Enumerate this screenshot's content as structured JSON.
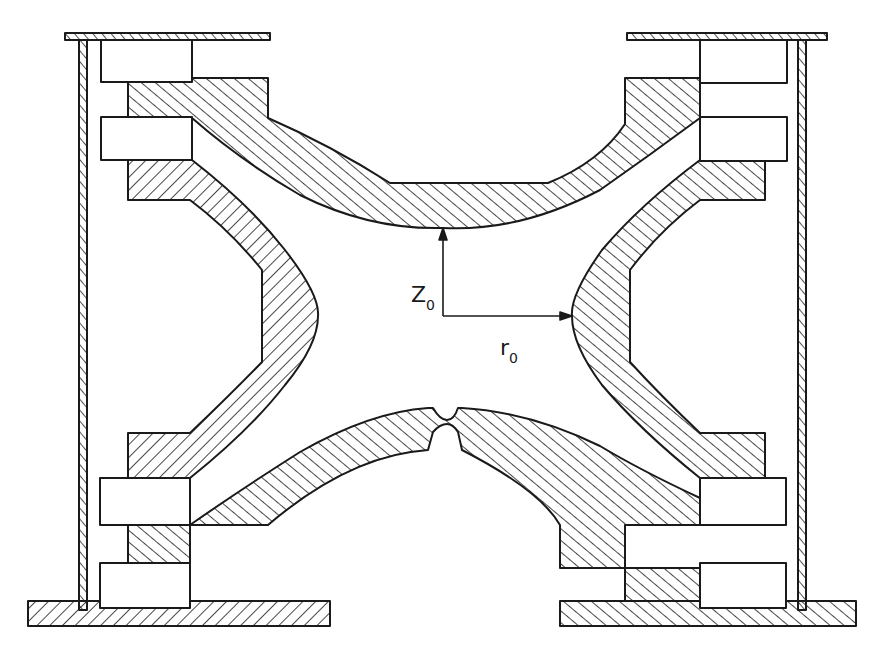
{
  "figure": {
    "colors": {
      "line": "#1a1a1a",
      "background": "#ffffff",
      "hatch": "#1a1a1a"
    }
  },
  "labels": {
    "z0": {
      "main": "Z",
      "sub": "0"
    },
    "r0": {
      "main": "r",
      "sub": "0"
    }
  },
  "dimensions": {
    "z0_arrow": {
      "from": [
        443,
        316
      ],
      "to": [
        443,
        228
      ]
    },
    "r0_arrow": {
      "from": [
        443,
        316
      ],
      "to": [
        572,
        316
      ]
    }
  },
  "components": [
    {
      "id": "top-endcap",
      "name": "Upper endcap electrode"
    },
    {
      "id": "bottom-endcap",
      "name": "Lower endcap electrode"
    },
    {
      "id": "ring-left",
      "name": "Ring electrode (left section)"
    },
    {
      "id": "ring-right",
      "name": "Ring electrode (right section)"
    },
    {
      "id": "spacers",
      "name": "Insulating spacers"
    },
    {
      "id": "frame",
      "name": "Support plates and side walls"
    }
  ]
}
